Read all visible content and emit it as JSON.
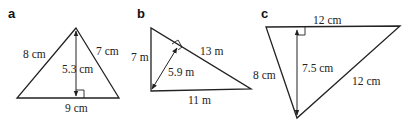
{
  "figures": [
    {
      "letter": "a",
      "shape": "triangle",
      "sides": [
        {
          "name": "left",
          "label": "8 cm"
        },
        {
          "name": "right",
          "label": "7 cm"
        },
        {
          "name": "base",
          "label": "9 cm"
        }
      ],
      "height": {
        "label": "5.3 cm",
        "perpendicular_to": "base"
      }
    },
    {
      "letter": "b",
      "shape": "triangle",
      "sides": [
        {
          "name": "left",
          "label": "7 m"
        },
        {
          "name": "hypotenuse",
          "label": "13 m"
        },
        {
          "name": "base",
          "label": "11 m"
        }
      ],
      "height": {
        "label": "5.9 m",
        "perpendicular_to": "hypotenuse"
      }
    },
    {
      "letter": "c",
      "shape": "triangle",
      "sides": [
        {
          "name": "top",
          "label": "12 cm"
        },
        {
          "name": "left",
          "label": "8 cm"
        },
        {
          "name": "right",
          "label": "12 cm"
        }
      ],
      "height": {
        "label": "7.5 cm",
        "perpendicular_to": "top"
      }
    }
  ],
  "colors": {
    "stroke": "#222222",
    "background": "#ffffff"
  }
}
